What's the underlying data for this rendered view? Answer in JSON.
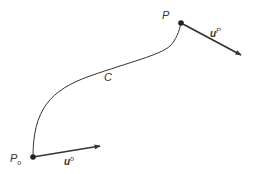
{
  "diagram": {
    "curve": {
      "label": "C"
    },
    "start_point": {
      "label": "P",
      "subscript": "o"
    },
    "end_point": {
      "label": "P"
    },
    "start_vector": {
      "label": "u",
      "superscript": "o"
    },
    "end_vector": {
      "label": "u",
      "superscript": "P"
    },
    "colors": {
      "stroke": "#333333",
      "background": "#ffffff"
    }
  }
}
